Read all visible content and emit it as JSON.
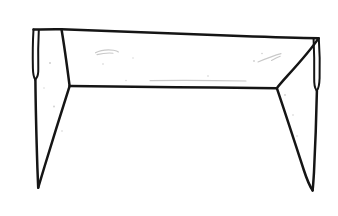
{
  "document": {
    "title": "Hand-drawn line sketch",
    "subject": "table-like figure with two flared legs",
    "medium": "black ink on white paper",
    "width": 338,
    "height": 216
  },
  "colors": {
    "background": "#ffffff",
    "ink": "#151515",
    "smudge": "#c9c9c9",
    "speck": "#cfcfcf"
  },
  "drawing": {
    "name": "table-figure",
    "strokes": {
      "top_edge": {
        "name": "top-edge",
        "path": "M33.5,29.5 C 45,29.2 54,29.0 61.5,29.2 C 110,31.0 180,33.8 240,36.0 C 280,37.4 304,38.0 318.5,38.2"
      },
      "left_flap_outer": {
        "name": "left-flap-outer-edge",
        "path": "M33.5,29.5 C 32.8,41 32.6,55 32.9,68.2 C 33.0,73.5 33.6,77.0 35.2,79.6"
      },
      "left_flap_inner": {
        "name": "left-flap-inner-edge",
        "path": "M38.8,30.2 C 38.2,42 38.0,56 38.3,68.5 C 38.4,73.0 38.0,76.2 36.4,78.0 C 35.9,78.6 35.5,79.1 35.2,79.6"
      },
      "left_shoulder_diagonal": {
        "name": "left-shoulder-diagonal",
        "path": "M61.5,29.2 C 64.0,44 66.8,64 69.6,85.8"
      },
      "left_leg_outer": {
        "name": "left-leg-outer-edge",
        "path": "M35.4,79.8 C 35.6,103 36.5,140 37.4,168 C 37.8,178 38.0,184 38.2,187.6"
      },
      "left_leg_inner": {
        "name": "left-leg-inner-edge",
        "path": "M69.6,86.2 C 62.0,110 52.0,142 44.4,167 C 41.4,177 39.4,183.6 38.2,187.6"
      },
      "middle_band": {
        "name": "middle-horizontal-band",
        "path": "M69.8,86.0 C 110,86.4 165,87.0 215,87.6 C 248,88.0 268,88.2 276.8,88.2"
      },
      "right_shoulder_diagonal": {
        "name": "right-shoulder-diagonal",
        "path": "M318.5,38.4 C 312.0,48 300.0,62 288.0,75.2 C 282.6,81.2 278.8,85.6 276.8,88.2"
      },
      "right_flap_outer": {
        "name": "right-flap-outer-edge",
        "path": "M318.8,38.3 C 319.6,50 320.0,64 319.6,78.0 C 319.4,84.5 318.6,88.6 316.8,90.8"
      },
      "right_flap_inner": {
        "name": "right-flap-inner-edge",
        "path": "M313.6,39.0 C 314.2,51 314.4,65 314.2,78.4 C 314.1,84.0 314.8,87.8 316.2,89.8 C 316.5,90.2 316.7,90.5 316.8,90.8"
      },
      "right_leg_outer": {
        "name": "right-leg-outer-edge",
        "path": "M316.9,91.0 C 316.4,114 315.2,148 314.0,172 C 313.4,182 313.0,187 312.6,190.4"
      },
      "right_leg_inner": {
        "name": "right-leg-inner-edge",
        "path": "M277.0,88.6 C 285.0,112 295.6,145 303.8,170 C 307.4,181 310.6,187.4 312.6,190.4"
      }
    },
    "vertices": {
      "top_left_corner": [
        33.5,
        29.5
      ],
      "top_left_break": [
        61.5,
        29.2
      ],
      "top_right_corner": [
        318.5,
        38.2
      ],
      "left_junction": [
        69.7,
        86.0
      ],
      "right_junction": [
        276.9,
        88.3
      ],
      "left_flap_hook": [
        35.3,
        79.6
      ],
      "right_flap_hook": [
        316.8,
        90.8
      ],
      "left_leg_tip": [
        38.2,
        187.6
      ],
      "right_leg_tip": [
        312.6,
        190.4
      ]
    },
    "marks": [
      {
        "name": "eraser-smudge-left",
        "path": "M95.5,52.8 C 100,50.4 107,49.4 113.5,50.2 C 116,50.6 117.6,51.2 118.4,52.0"
      },
      {
        "name": "eraser-smudge-left-tail",
        "path": "M97.0,54.6 C 102,53.4 108,52.8 113.0,53.2"
      },
      {
        "name": "eraser-smudge-right",
        "path": "M258.0,62.0 C 266,58.6 274,55.4 281.0,53.6"
      },
      {
        "name": "eraser-smudge-right-short",
        "path": "M271.5,60.4 C 275,58.4 278,57.0 280.2,56.2"
      },
      {
        "name": "faint-line-under-band",
        "path": "M150.0,80.6 C 180,80.2 215,80.4 246,81.0"
      }
    ],
    "specks": [
      {
        "name": "paper-speck",
        "cx": 50.0,
        "cy": 63.0,
        "r": 1.0
      },
      {
        "name": "paper-speck",
        "cx": 54.0,
        "cy": 106.5,
        "r": 0.9
      },
      {
        "name": "paper-speck",
        "cx": 62.0,
        "cy": 131.0,
        "r": 0.8
      },
      {
        "name": "paper-speck",
        "cx": 103.0,
        "cy": 64.0,
        "r": 0.8
      },
      {
        "name": "paper-speck",
        "cx": 126.0,
        "cy": 80.5,
        "r": 0.7
      },
      {
        "name": "paper-speck",
        "cx": 133.0,
        "cy": 58.0,
        "r": 0.7
      },
      {
        "name": "paper-speck",
        "cx": 208.0,
        "cy": 76.0,
        "r": 0.8
      },
      {
        "name": "paper-speck",
        "cx": 254.0,
        "cy": 61.0,
        "r": 0.9
      },
      {
        "name": "paper-speck",
        "cx": 262.0,
        "cy": 53.5,
        "r": 0.8
      },
      {
        "name": "paper-speck",
        "cx": 285.0,
        "cy": 95.0,
        "r": 0.9
      },
      {
        "name": "paper-speck",
        "cx": 293.0,
        "cy": 115.0,
        "r": 0.8
      },
      {
        "name": "paper-speck",
        "cx": 297.0,
        "cy": 136.0,
        "r": 0.8
      },
      {
        "name": "paper-speck",
        "cx": 44.0,
        "cy": 88.0,
        "r": 0.7
      }
    ]
  }
}
